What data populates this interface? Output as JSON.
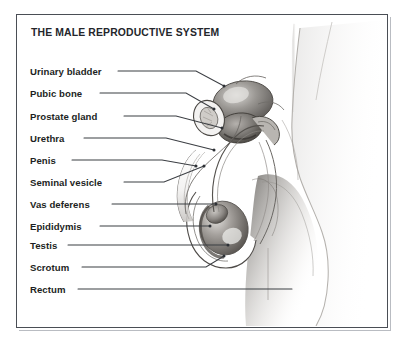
{
  "figure": {
    "title": "THE MALE REPRODUCTIVE SYSTEM",
    "type": "anatomical-diagram",
    "style": "grayscale pencil illustration, sagittal section of male pelvis with body profile",
    "frame_color": "#4a4e55",
    "background_color": "#ffffff",
    "text_color": "#1d1f23"
  },
  "labels": [
    {
      "id": "urinary-bladder",
      "text": "Urinary bladder",
      "y": 71,
      "line_end_x": 224,
      "line_end_y": 86
    },
    {
      "id": "pubic-bone",
      "text": "Pubic bone",
      "y": 93,
      "line_end_x": 216,
      "line_end_y": 108
    },
    {
      "id": "prostate-gland",
      "text": "Prostate gland",
      "y": 116,
      "line_end_x": 243,
      "line_end_y": 128
    },
    {
      "id": "urethra",
      "text": "Urethra",
      "y": 138,
      "line_end_x": 236,
      "line_end_y": 150
    },
    {
      "id": "penis",
      "text": "Penis",
      "y": 160,
      "line_end_x": 213,
      "line_end_y": 172
    },
    {
      "id": "seminal-vesicle",
      "text": "Seminal vesicle",
      "y": 182,
      "line_end_x": 228,
      "line_end_y": 175
    },
    {
      "id": "vas-deferens",
      "text": "Vas deferens",
      "y": 204,
      "line_end_x": 232,
      "line_end_y": 204
    },
    {
      "id": "epididymis",
      "text": "Epididymis",
      "y": 226,
      "line_end_x": 224,
      "line_end_y": 226
    },
    {
      "id": "testis",
      "text": "Testis",
      "y": 245,
      "line_end_x": 234,
      "line_end_y": 245
    },
    {
      "id": "scrotum",
      "text": "Scrotum",
      "y": 267,
      "line_end_x": 226,
      "line_end_y": 256
    },
    {
      "id": "rectum",
      "text": "Rectum",
      "y": 289,
      "line_end_x": 292,
      "line_end_y": 289
    }
  ]
}
